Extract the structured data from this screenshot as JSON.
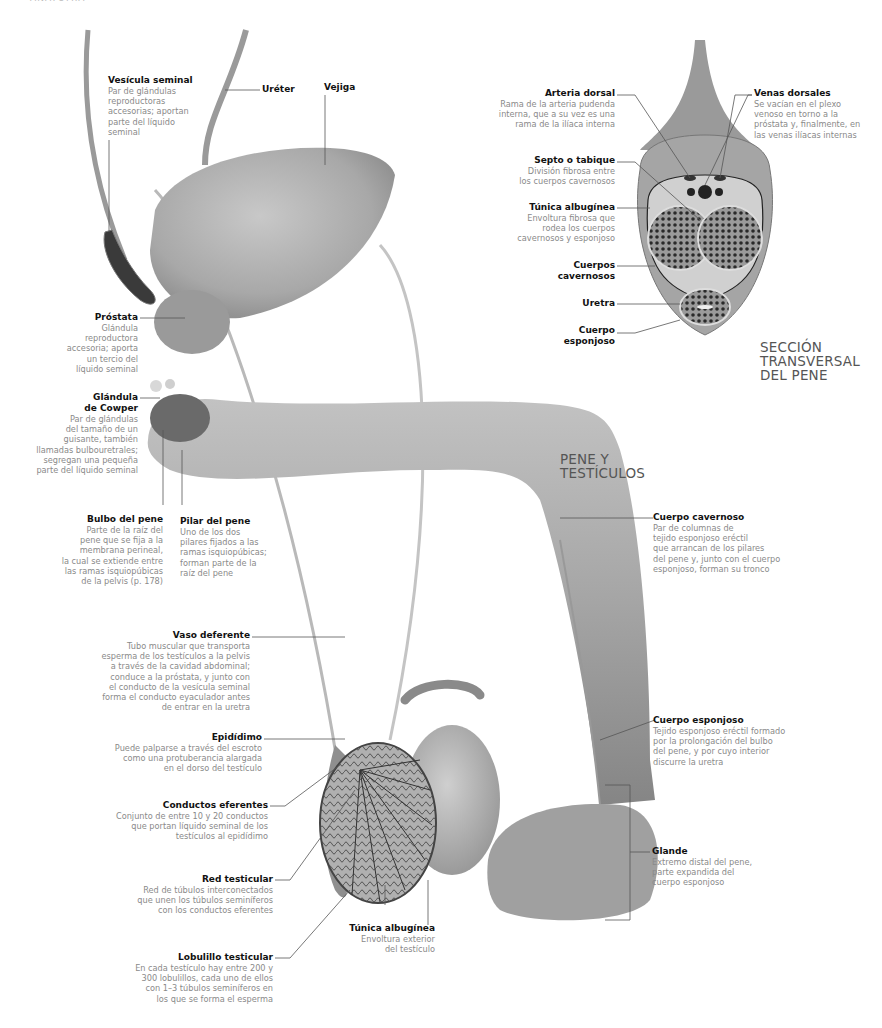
{
  "page_header": "ANATOMÍA",
  "titles": {
    "main": [
      "PENE Y",
      "TESTÍCULOS"
    ],
    "cross_section": [
      "SECCIÓN",
      "TRANSVERSAL",
      "DEL PENE"
    ]
  },
  "labels": {
    "vesicula_seminal": {
      "title": "Vesícula seminal",
      "desc": [
        "Par de glándulas",
        "reproductoras",
        "accesorias; aportan",
        "parte del líquido",
        "seminal"
      ]
    },
    "ureter": {
      "title": "Uréter"
    },
    "vejiga": {
      "title": "Vejiga"
    },
    "prostata": {
      "title": "Próstata",
      "desc": [
        "Glándula",
        "reproductora",
        "accesoria; aporta",
        "un tercio del",
        "líquido seminal"
      ]
    },
    "cowper": {
      "title": [
        "Glándula",
        "de Cowper"
      ],
      "desc": [
        "Par de glándulas",
        "del tamaño de un",
        "guisante, también",
        "llamadas bulbouretrales;",
        "segregan una pequeña",
        "parte del líquido seminal"
      ]
    },
    "bulbo": {
      "title": "Bulbo del pene",
      "desc": [
        "Parte de la raíz del",
        "pene que se fija a la",
        "membrana perineal,",
        "la cual se extiende entre",
        "las ramas isquiopúbicas",
        "de la pelvis (p. 178)"
      ]
    },
    "pilar": {
      "title": "Pilar del pene",
      "desc": [
        "Uno de los dos",
        "pilares fijados a las",
        "ramas isquiopúbicas;",
        "forman parte de la",
        "raíz del pene"
      ]
    },
    "cuerpo_cavernoso": {
      "title": "Cuerpo cavernoso",
      "desc": [
        "Par de columnas de",
        "tejido esponjoso eréctil",
        "que arrancan de los pilares",
        "del pene y, junto con el cuerpo",
        "esponjoso, forman su tronco"
      ]
    },
    "vaso_deferente": {
      "title": "Vaso deferente",
      "desc": [
        "Tubo muscular que transporta",
        "esperma de los testículos a la pelvis",
        "a través de la cavidad abdominal;",
        "conduce a la próstata, y junto con",
        "el conducto de la vesícula seminal",
        "forma el conducto eyaculador antes",
        "de entrar en la uretra"
      ]
    },
    "epididimo": {
      "title": "Epidídimo",
      "desc": [
        "Puede palparse a través del escroto",
        "como una protuberancia alargada",
        "en el dorso del testículo"
      ]
    },
    "conductos_eferentes": {
      "title": "Conductos eferentes",
      "desc": [
        "Conjunto de entre 10 y 20 conductos",
        "que portan líquido seminal de los",
        "testículos al epidídimo"
      ]
    },
    "red_testicular": {
      "title": "Red testicular",
      "desc": [
        "Red de túbulos interconectados",
        "que unen los túbulos seminíferos",
        "con los conductos eferentes"
      ]
    },
    "lobulillo": {
      "title": "Lobulillo testicular",
      "desc": [
        "En cada testículo hay entre 200 y",
        "300 lobulillos, cada uno de ellos",
        "con 1–3 túbulos seminíferos en",
        "los que se forma el esperma"
      ]
    },
    "tunica_testiculo": {
      "title": "Túnica albugínea",
      "desc": [
        "Envoltura exterior",
        "del testículo"
      ]
    },
    "cuerpo_esponjoso": {
      "title": "Cuerpo esponjoso",
      "desc": [
        "Tejido esponjoso eréctil formado",
        "por la prolongación del bulbo",
        "del pene, y por cuyo interior",
        "discurre la uretra"
      ]
    },
    "glande": {
      "title": "Glande",
      "desc": [
        "Extremo distal del pene,",
        "parte expandida del",
        "cuerpo esponjoso"
      ]
    },
    "arteria_dorsal": {
      "title": "Arteria dorsal",
      "desc": [
        "Rama de la arteria pudenda",
        "interna, que a su vez es una",
        "rama de la ilíaca interna"
      ]
    },
    "venas_dorsales": {
      "title": "Venas dorsales",
      "desc": [
        "Se vacían en el plexo",
        "venoso en torno a la",
        "próstata y, finalmente, en",
        "las venas ilíacas internas"
      ]
    },
    "septo": {
      "title": "Septo o tabique",
      "desc": [
        "División fibrosa entre",
        "los cuerpos cavernosos"
      ]
    },
    "tunica_pene": {
      "title": "Túnica albugínea",
      "desc": [
        "Envoltura fibrosa que",
        "rodea los cuerpos",
        "cavernosos y esponjoso"
      ]
    },
    "cuerpos_cavernosos": {
      "title": [
        "Cuerpos",
        "cavernosos"
      ]
    },
    "uretra": {
      "title": "Uretra"
    },
    "cuerpo_esponjoso_sec": {
      "title": [
        "Cuerpo",
        "esponjoso"
      ]
    }
  },
  "colors": {
    "organ": "#a9a9a9",
    "organ_dark": "#7a7a7a",
    "leader": "#555555",
    "label_title": "#111111",
    "label_desc": "#8a8a8a"
  }
}
